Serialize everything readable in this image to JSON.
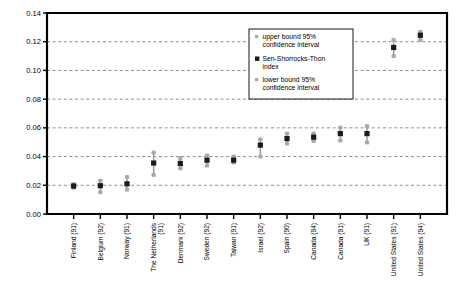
{
  "chart_data": {
    "type": "scatter",
    "title": "",
    "subtitle": "",
    "xlabel": "",
    "ylabel": "",
    "ylim": [
      0.0,
      0.14
    ],
    "ytick_labels": [
      "0.00",
      "0.02",
      "0.04",
      "0.06",
      "0.08",
      "0.10",
      "0.12",
      "0.14"
    ],
    "ytick_values": [
      0.0,
      0.02,
      0.04,
      0.06,
      0.08,
      0.1,
      0.12,
      0.14
    ],
    "grid": true,
    "grid_axis": "y",
    "legend_position": "upper-center",
    "legend": [
      "upper bound 95% confidence interval",
      "Sen-Shorrocks-Thon index",
      "lower bound 95% confidence interval"
    ],
    "categories": [
      "Finland (91)",
      "Belgium (92)",
      "Norway (91)",
      "The Netherlands (91)",
      "Denmark (92)",
      "Sweden (92)",
      "Taiwan (91)",
      "Israel (92)",
      "Spain (90)",
      "Canada (94)",
      "Canada (91)",
      "UK (91)",
      "United States (91)",
      "United States (94)"
    ],
    "series": [
      {
        "name": "Sen-Shorrocks-Thon index",
        "values": [
          0.0195,
          0.0197,
          0.021,
          0.0355,
          0.0352,
          0.0375,
          0.0375,
          0.048,
          0.0525,
          0.0535,
          0.056,
          0.056,
          0.116,
          0.1245
        ]
      },
      {
        "name": "upper bound 95% confidence interval",
        "values": [
          0.0208,
          0.0232,
          0.0258,
          0.0428,
          0.039,
          0.0408,
          0.04,
          0.052,
          0.056,
          0.056,
          0.0602,
          0.0612,
          0.1212,
          0.1268
        ]
      },
      {
        "name": "lower bound 95% confidence interval",
        "values": [
          0.0182,
          0.0152,
          0.017,
          0.0272,
          0.0318,
          0.0338,
          0.0358,
          0.04,
          0.049,
          0.0508,
          0.0512,
          0.0498,
          0.11,
          0.1212
        ]
      }
    ]
  },
  "legend_entries": [
    {
      "label_line1": "upper bound 95%",
      "label_line2": "confidence interval",
      "marker": "bound"
    },
    {
      "label_line1": "Sen-Shorrocks-Thon",
      "label_line2": "index",
      "marker": "index"
    },
    {
      "label_line1": "lower bound 95%",
      "label_line2": "confidence interval",
      "marker": "bound"
    }
  ],
  "colors": {
    "index_marker": "#1b1b1b",
    "bound_marker": "#a8a8a8",
    "error_bar": "#9c9c9c",
    "grid": "#7a7a7a",
    "axis": "#000000",
    "background": "#ffffff"
  }
}
